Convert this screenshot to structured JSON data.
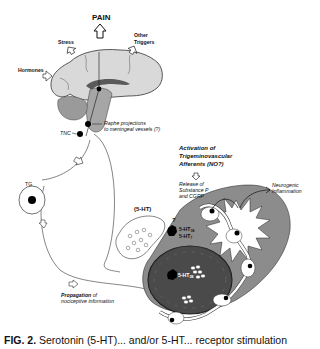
{
  "figure": {
    "labels": {
      "pain": "PAIN",
      "stress": "Stress",
      "other_triggers_1": "Other",
      "other_triggers_2": "Triggers",
      "hormones": "Hormones",
      "raphe_1": "Raphe projections",
      "raphe_2": "to meningeal vessels (?)",
      "tnc": "TNC",
      "tg": "TG",
      "activation_1": "Activation of",
      "activation_2": "Trigeminovascular",
      "activation_3": "Afferents (NO?)",
      "release_1": "Release of",
      "release_2": "Substance P",
      "release_3": "and CGRP",
      "neurogenic_1": "Neurogenic",
      "neurogenic_2": "Inflammation",
      "five_ht": "(5-HT)",
      "question": "?",
      "receptor_1b_base": "5-HT",
      "receptor_1b_sub": "1B",
      "receptor_7_base": "5-HT",
      "receptor_7_sub": "7",
      "receptor_2b_base": "5-HT",
      "receptor_2b_sub": "2B",
      "propagation_bold": "Propagation",
      "propagation_rest": " of",
      "propagation_2": "nociceptive information"
    },
    "caption": {
      "fig_label": "FIG. 2.",
      "text": "  Serotonin (5-HT)... and/or 5-HT... receptor stimulation"
    },
    "colors": {
      "brain_light": "#d9d9d9",
      "brain_mid": "#a6a6a6",
      "brain_dark": "#5a5a5a",
      "vessel_outer": "#8c8c8c",
      "vessel_inner": "#4a4a4a",
      "ink": "#111111"
    }
  }
}
